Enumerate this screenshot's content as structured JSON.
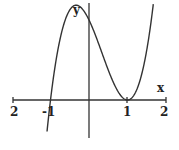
{
  "chart_data": {
    "type": "line",
    "title": "",
    "xlabel": "x",
    "ylabel": "y",
    "function": "f(x) = (x+1)(x-1)^2",
    "x_ticks": [
      -2,
      -1,
      1,
      2
    ],
    "x_tick_labels": [
      "2",
      "-1",
      "1",
      "2"
    ],
    "xlim": [
      -2,
      2
    ],
    "ylim": [
      -0.5,
      1.2
    ],
    "grid": false,
    "series": [
      {
        "name": "f(x)",
        "x": [
          -1.1,
          -1.0,
          -0.8,
          -0.6,
          -0.333,
          0.0,
          0.3,
          0.6,
          0.8,
          1.0,
          1.2,
          1.4,
          1.7
        ],
        "values": [
          -0.44,
          0.0,
          0.648,
          1.024,
          1.185,
          1.0,
          0.637,
          0.256,
          0.072,
          0.0,
          0.088,
          0.384,
          1.323
        ]
      }
    ],
    "annotations": {
      "roots": [
        -1,
        1
      ],
      "local_max_x": -0.333,
      "local_min_x": 1
    }
  },
  "labels": {
    "x_axis": "x",
    "y_axis": "y",
    "tick_left_2": "2",
    "tick_neg1": "-1",
    "tick_pos1": "1",
    "tick_right_2": "2"
  }
}
